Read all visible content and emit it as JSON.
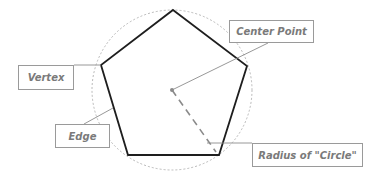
{
  "diagram": {
    "labels": {
      "center_point": "Center Point",
      "vertex": "Vertex",
      "edge": "Edge",
      "radius": "Radius of \"Circle\""
    },
    "colors": {
      "polygon_stroke": "#1e1e1e",
      "circle_stroke": "#a8a8a8",
      "leader_stroke": "#8c8c8c",
      "radius_stroke": "#8a8a8a",
      "label_text": "#7a7a7a",
      "label_border": "#9a9a9a"
    }
  }
}
